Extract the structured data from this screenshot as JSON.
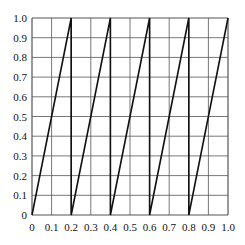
{
  "chart_data": {
    "type": "line",
    "title": "",
    "xlabel": "",
    "ylabel": "",
    "xlim": [
      0,
      1
    ],
    "ylim": [
      0,
      1
    ],
    "grid": true,
    "legend": null,
    "x_ticks": [
      "0",
      "0.1",
      "0.2",
      "0.3",
      "0.4",
      "0.5",
      "0.6",
      "0.7",
      "0.8",
      "0.9",
      "1.0"
    ],
    "y_ticks": [
      "0",
      "0.1",
      "0.2",
      "0.3",
      "0.4",
      "0.5",
      "0.6",
      "0.7",
      "0.8",
      "0.9",
      "1.0"
    ],
    "series": [
      {
        "name": "sawtooth",
        "description": "y = frac(5x), rises linearly from 0 to 1 over each interval of width 0.2, with vertical drops at x = 0.2, 0.4, 0.6, 0.8",
        "x": [
          0,
          0.2,
          0.2,
          0.4,
          0.4,
          0.6,
          0.6,
          0.8,
          0.8,
          1.0
        ],
        "y": [
          0,
          1,
          0,
          1,
          0,
          1,
          0,
          1,
          0,
          1
        ]
      }
    ],
    "colors": {
      "line": "#111111",
      "grid": "#555555",
      "background": "#ffffff"
    }
  }
}
